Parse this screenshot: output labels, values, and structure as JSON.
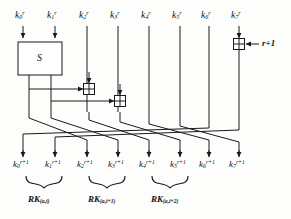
{
  "figure": {
    "type": "block-diagram",
    "ink_color": "#1a1a1a",
    "background_color": "#fdfdfb"
  },
  "inputs": {
    "note": "Eight input key words of round r, left to right",
    "items": [
      {
        "name": "k0-in",
        "base": "k",
        "sub": "0",
        "sup": "r",
        "x": 23
      },
      {
        "name": "k1-in",
        "base": "k",
        "sub": "1",
        "sup": "r",
        "x": 55
      },
      {
        "name": "k2-in",
        "base": "k",
        "sub": "2",
        "sup": "r",
        "x": 87
      },
      {
        "name": "k3-in",
        "base": "k",
        "sub": "3",
        "sup": "r",
        "x": 118
      },
      {
        "name": "k4-in",
        "base": "k",
        "sub": "4",
        "sup": "r",
        "x": 149
      },
      {
        "name": "k5-in",
        "base": "k",
        "sub": "5",
        "sup": "r",
        "x": 180
      },
      {
        "name": "k6-in",
        "base": "k",
        "sub": "6",
        "sup": "r",
        "x": 209
      },
      {
        "name": "k7-in",
        "base": "k",
        "sub": "7",
        "sup": "r",
        "x": 239
      }
    ]
  },
  "outputs": {
    "note": "Eight output key words of round r+1, left to right",
    "items": [
      {
        "name": "k0-out",
        "base": "k",
        "sub": "0",
        "sup": "r+1",
        "x": 23
      },
      {
        "name": "k1-out",
        "base": "k",
        "sub": "1",
        "sup": "r+1",
        "x": 55
      },
      {
        "name": "k2-out",
        "base": "k",
        "sub": "2",
        "sup": "r+1",
        "x": 87
      },
      {
        "name": "k3-out",
        "base": "k",
        "sub": "3",
        "sup": "r+1",
        "x": 118
      },
      {
        "name": "k4-out",
        "base": "k",
        "sub": "4",
        "sup": "r+1",
        "x": 149
      },
      {
        "name": "k5-out",
        "base": "k",
        "sub": "5",
        "sup": "r+1",
        "x": 180
      },
      {
        "name": "k6-out",
        "base": "k",
        "sub": "6",
        "sup": "r+1",
        "x": 209
      },
      {
        "name": "k7-out",
        "base": "k",
        "sub": "7",
        "sup": "r+1",
        "x": 239
      }
    ]
  },
  "sbox": {
    "label": "S",
    "x": 18,
    "y": 42,
    "width": 44,
    "height": 33
  },
  "xor_gates": [
    {
      "name": "xor-1",
      "cx": 89,
      "cy": 89,
      "size": 11,
      "glyph": "plus"
    },
    {
      "name": "xor-2",
      "cx": 120,
      "cy": 101,
      "size": 11,
      "glyph": "plus"
    },
    {
      "name": "xor-round-constant",
      "cx": 239,
      "cy": 44,
      "size": 11,
      "glyph": "plus"
    }
  ],
  "round_constant": {
    "label": "r+1",
    "x": 262,
    "y": 40
  },
  "round_keys": {
    "note": "Curly braces group output pairs into round keys",
    "items": [
      {
        "name": "rk-0",
        "base": "RK",
        "sub": "(a,i)",
        "x": 58,
        "brace_left": 24,
        "brace_right": 88
      },
      {
        "name": "rk-1",
        "base": "RK",
        "sub": "(a,i+1)",
        "x": 120,
        "brace_left": 88,
        "brace_right": 152
      },
      {
        "name": "rk-2",
        "base": "RK",
        "sub": "(a,i+2)",
        "x": 184,
        "brace_left": 152,
        "brace_right": 216
      }
    ]
  },
  "permutation": {
    "note": "Crossing wires mapping inputs to outputs",
    "pairs": [
      {
        "from_x": 23,
        "to_x": 87
      },
      {
        "from_x": 55,
        "to_x": 118
      },
      {
        "from_x": 89,
        "to_x": 149
      },
      {
        "from_x": 120,
        "to_x": 180
      },
      {
        "from_x": 149,
        "to_x": 209
      },
      {
        "from_x": 180,
        "to_x": 239
      },
      {
        "from_x": 209,
        "to_x": 23
      },
      {
        "from_x": 239,
        "to_x": 55
      }
    ]
  }
}
